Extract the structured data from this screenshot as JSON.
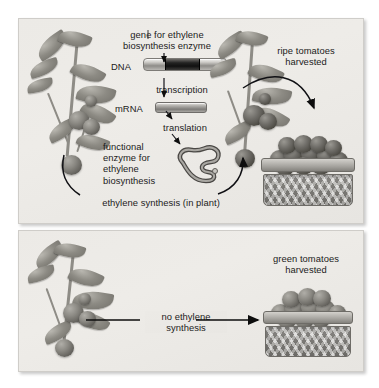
{
  "figure": {
    "type": "biology-process-diagram",
    "panels": [
      {
        "id": "top",
        "name": "normal-plant-panel",
        "description": "Plant with functional ethylene biosynthesis gene produces ethylene and ripe tomatoes"
      },
      {
        "id": "bottom",
        "name": "no-ethylene-panel",
        "description": "Plant without ethylene synthesis yields green tomatoes"
      }
    ]
  },
  "top_panel": {
    "gene_label": "gene for ethylene\nbiosynthesis enzyme",
    "dna_label": "DNA",
    "transcription_label": "transcription",
    "mrna_label": "mRNA",
    "translation_label": "translation",
    "enzyme_label": "functional\nenzyme for\nethylene\nbiosynthesis",
    "cycle_label": "ethylene synthesis (in plant)",
    "harvest_label": "ripe tomatoes\nharvested"
  },
  "bottom_panel": {
    "process_label": "no ethylene\nsynthesis",
    "harvest_label": "green tomatoes\nharvested"
  },
  "elements": {
    "dna_strand": "dna-double-strand-bar",
    "gene_segment": "highlighted-gene-segment",
    "mrna_strand": "mrna-bar",
    "enzyme_shape": "folded-protein-squiggle",
    "plant_left_top": "tomato-plant-with-fruit",
    "plant_right_top": "tomato-plant-with-ripe-fruit",
    "plant_left_bottom": "tomato-plant-with-green-fruit",
    "basket_ripe": "basket-of-ripe-tomatoes",
    "basket_green": "basket-of-green-tomatoes"
  },
  "colors": {
    "panel_background": "#eceae6",
    "panel_border": "#cfcdc9",
    "text": "#1b1b1b",
    "gene_segment": "#111111",
    "arrow": "#0d0d0d",
    "ripe_tomato": "#48463f",
    "green_tomato": "#8b8983"
  }
}
